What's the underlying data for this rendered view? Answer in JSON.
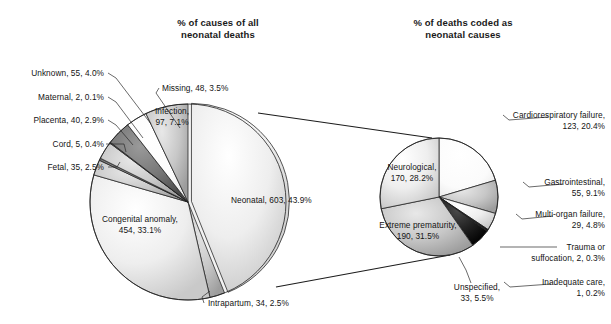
{
  "figure": {
    "width": 611,
    "height": 324,
    "background": "#ffffff"
  },
  "left_chart": {
    "title_line1": "% of causes of all",
    "title_line2": "neonatal deaths",
    "title_x": 218,
    "title_y1": 26,
    "title_y2": 38,
    "center_x": 188,
    "center_y": 202,
    "radius": 98,
    "start_angle": -90
  },
  "right_chart": {
    "title_line1": "% of deaths coded as",
    "title_line2": "neonatal causes",
    "title_x": 463,
    "title_y1": 26,
    "title_y2": 38,
    "center_x": 439,
    "center_y": 197,
    "radius": 59,
    "start_angle": -90
  },
  "explode_lines": [
    {
      "x1": 258,
      "y1": 113,
      "x2": 432,
      "y2": 138
    },
    {
      "x1": 276,
      "y1": 287,
      "x2": 450,
      "y2": 255
    }
  ],
  "left_labels": [
    {
      "name": "unknown",
      "text": "Unknown, 55, 4.0%",
      "x": 104,
      "y": 76,
      "anchor": "end",
      "leader": "M108,73 L116,78 L151,124"
    },
    {
      "name": "maternal",
      "text": "Maternal, 2, 0.1%",
      "x": 104,
      "y": 100,
      "anchor": "end",
      "leader": "M108,97 L116,102 L143,138"
    },
    {
      "name": "placenta",
      "text": "Placenta, 40, 2.9%",
      "x": 104,
      "y": 123,
      "anchor": "end",
      "leader": "M108,120 L116,125 L133,145"
    },
    {
      "name": "cord",
      "text": "Cord, 5, 0.4%",
      "x": 104,
      "y": 147,
      "anchor": "end",
      "leader": "M106,144 L124,144 L126,152"
    },
    {
      "name": "fetal",
      "text": "Fetal, 35, 2.5%",
      "x": 104,
      "y": 170,
      "anchor": "end",
      "leader": "M108,167 L117,167 L120,162"
    },
    {
      "name": "missing",
      "text": "Missing, 48, 3.5%",
      "x": 162,
      "y": 91,
      "anchor": "start",
      "leader": "M159,88 L156,93 L180,128"
    },
    {
      "name": "intrapartum",
      "text": "Intrapartum, 34, 2.5%",
      "x": 208,
      "y": 306,
      "anchor": "start",
      "leader": "M204,303 L202,297 L210,291"
    }
  ],
  "left_inner_labels": [
    {
      "name": "infection",
      "line1": "Infection,",
      "line2": "97, 7.1%",
      "x": 172,
      "y": 114,
      "anchor": "middle",
      "line_height": 11
    },
    {
      "name": "neonatal",
      "line1": "Neonatal, 603, 43.9%",
      "line2": "",
      "x": 231,
      "y": 203,
      "anchor": "start",
      "line_height": 11
    },
    {
      "name": "congenital",
      "line1": "Congenital anomaly,",
      "line2": "454, 33.1%",
      "x": 140,
      "y": 222,
      "anchor": "middle",
      "line_height": 11
    }
  ],
  "right_labels": [
    {
      "name": "cardiorespiratory",
      "line1": "Cardiorespiratory failure,",
      "line2": "123, 20.4%",
      "x": 605,
      "y": 118,
      "anchor": "end",
      "leader": "M503,115 L509,120 L548,117"
    },
    {
      "name": "gastrointestinal",
      "line1": "Gastrointestinal,",
      "line2": "55, 9.1%",
      "x": 605,
      "y": 185,
      "anchor": "end",
      "leader": "M523,182 L529,187 L563,184"
    },
    {
      "name": "multi-organ",
      "line1": "Multi-organ failure,",
      "line2": "29, 4.8%",
      "x": 605,
      "y": 217,
      "anchor": "end",
      "leader": "M516,214 L522,219 L553,216"
    },
    {
      "name": "trauma",
      "line1": "Trauma or",
      "line2": "suffocation, 2, 0.3%",
      "x": 605,
      "y": 250,
      "anchor": "end",
      "leader": "M500,247 L525,247 L557,247"
    },
    {
      "name": "inadequate-care",
      "line1": "Inadequate care,",
      "line2": "1, 0.2%",
      "x": 605,
      "y": 285,
      "anchor": "end",
      "leader": "M504,282 L510,287 L551,284"
    },
    {
      "name": "unspecified",
      "line1": "Unspecified,",
      "line2": "33, 5.5%",
      "x": 477,
      "y": 290,
      "anchor": "middle",
      "leader": "M471,283 L466,270 L459,257"
    }
  ],
  "right_inner_labels": [
    {
      "name": "neurological",
      "line1": "Neurological,",
      "line2": "170, 28.2%",
      "x": 412,
      "y": 170,
      "anchor": "middle",
      "line_height": 11
    },
    {
      "name": "extreme-prematurity",
      "line1": "Extreme prematurity,",
      "line2": "190, 31.5%",
      "x": 418,
      "y": 228,
      "anchor": "middle",
      "line_height": 11
    }
  ],
  "chart_data": [
    {
      "type": "pie",
      "title": "% of causes of all neonatal deaths",
      "name": "causes-of-all-neonatal-deaths",
      "total": 1373,
      "legend": "labels-with-leader-lines",
      "categories": [
        "Neonatal",
        "Intrapartum",
        "Congenital anomaly",
        "Fetal",
        "Cord",
        "Placenta",
        "Maternal",
        "Unknown",
        "Missing",
        "Infection"
      ],
      "values": [
        603,
        34,
        454,
        35,
        5,
        40,
        2,
        55,
        48,
        97
      ],
      "percents": [
        43.9,
        2.5,
        33.1,
        2.5,
        0.4,
        2.9,
        0.1,
        4.0,
        3.5,
        7.1
      ],
      "colors": [
        "#e2e2e2",
        "#b8b8b8",
        "#ededed",
        "#b0b0b0",
        "#2f2f2f",
        "#8f8f8f",
        "#3a3a3a",
        "#686868",
        "#f7f7f7",
        "#9a9a9a"
      ],
      "exploded_index": 0
    },
    {
      "type": "pie",
      "title": "% of deaths coded as neonatal causes",
      "name": "deaths-coded-as-neonatal-causes",
      "total": 603,
      "legend": "labels-with-leader-lines",
      "categories": [
        "Cardiorespiratory failure",
        "Gastrointestinal",
        "Multi-organ failure",
        "Trauma or suffocation",
        "Inadequate care",
        "Unspecified",
        "Extreme prematurity",
        "Neurological"
      ],
      "values": [
        123,
        55,
        29,
        2,
        1,
        33,
        190,
        170
      ],
      "percents": [
        20.4,
        9.1,
        4.8,
        0.3,
        0.2,
        5.5,
        31.5,
        28.2
      ],
      "colors": [
        "#fbfbfb",
        "#8a8a8a",
        "#f2f2f2",
        "#101010",
        "#5a5a5a",
        "#1c1c1c",
        "#c4c4c4",
        "#d8d8d8"
      ]
    }
  ]
}
